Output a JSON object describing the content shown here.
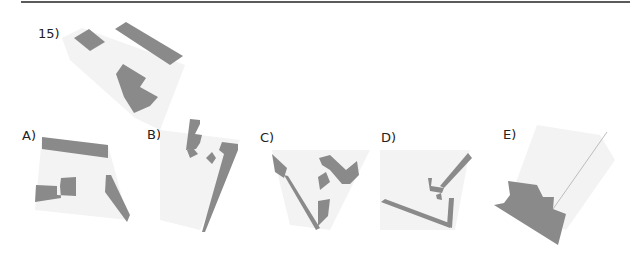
{
  "question": {
    "number_label": "15)",
    "options": [
      {
        "key": "A",
        "label": "A)"
      },
      {
        "key": "B",
        "label": "B)"
      },
      {
        "key": "C",
        "label": "C)"
      },
      {
        "key": "D",
        "label": "D)"
      },
      {
        "key": "E",
        "label": "E)"
      }
    ]
  },
  "colors": {
    "face_dark": "#8a8a8a",
    "face_light": "#f3f3f3",
    "rule": "#5a5a5a",
    "text": "#222222"
  },
  "shapes": {
    "question": {
      "light": [
        [
          62,
          38
        ],
        [
          82,
          28
        ],
        [
          185,
          65
        ],
        [
          160,
          130
        ],
        [
          135,
          118
        ],
        [
          70,
          60
        ]
      ],
      "dark": [
        [
          [
            74,
            38
          ],
          [
            89,
            29
          ],
          [
            105,
            42
          ],
          [
            90,
            51
          ]
        ],
        [
          [
            115,
            29
          ],
          [
            126,
            22
          ],
          [
            183,
            56
          ],
          [
            170,
            65
          ]
        ],
        [
          [
            116,
            74
          ],
          [
            123,
            64
          ],
          [
            146,
            78
          ],
          [
            140,
            87
          ],
          [
            158,
            97
          ],
          [
            150,
            106
          ],
          [
            134,
            113
          ],
          [
            124,
            97
          ]
        ]
      ]
    },
    "A": {
      "light": [
        [
          42,
          137
        ],
        [
          108,
          145
        ],
        [
          128,
          220
        ],
        [
          35,
          210
        ]
      ],
      "dark": [
        [
          [
            42,
            137
          ],
          [
            108,
            145
          ],
          [
            108,
            158
          ],
          [
            42,
            149
          ]
        ],
        [
          [
            106,
            175
          ],
          [
            111,
            175
          ],
          [
            130,
            215
          ],
          [
            127,
            222
          ],
          [
            105,
            192
          ]
        ],
        [
          [
            36,
            185
          ],
          [
            57,
            186
          ],
          [
            57,
            195
          ],
          [
            76,
            196
          ],
          [
            76,
            177
          ],
          [
            61,
            178
          ],
          [
            60,
            186
          ],
          [
            61,
            198
          ],
          [
            35,
            202
          ]
        ],
        [
          [
            62,
            179
          ],
          [
            76,
            178
          ],
          [
            76,
            193
          ],
          [
            62,
            193
          ]
        ]
      ]
    },
    "B": {
      "light": [
        [
          160,
          130
        ],
        [
          240,
          140
        ],
        [
          200,
          230
        ],
        [
          160,
          220
        ]
      ],
      "dark": [
        [
          [
            190,
            119
          ],
          [
            200,
            120
          ],
          [
            200,
            124
          ],
          [
            195,
            134
          ],
          [
            202,
            135
          ],
          [
            200,
            143
          ],
          [
            196,
            149
          ],
          [
            186,
            150
          ]
        ],
        [
          [
            187,
            150
          ],
          [
            193,
            148
          ],
          [
            198,
            154
          ],
          [
            190,
            158
          ]
        ],
        [
          [
            206,
            158
          ],
          [
            212,
            152
          ],
          [
            216,
            158
          ],
          [
            212,
            164
          ]
        ],
        [
          [
            222,
            142
          ],
          [
            238,
            144
          ],
          [
            238,
            150
          ],
          [
            205,
            232
          ],
          [
            202,
            232
          ],
          [
            224,
            154
          ],
          [
            219,
            150
          ]
        ]
      ]
    },
    "C": {
      "light": [
        [
          272,
          150
        ],
        [
          370,
          150
        ],
        [
          330,
          230
        ],
        [
          290,
          225
        ]
      ],
      "dark": [
        [
          [
            272,
            154
          ],
          [
            287,
            168
          ],
          [
            284,
            178
          ],
          [
            275,
            172
          ]
        ],
        [
          [
            284,
            175
          ],
          [
            288,
            176
          ],
          [
            320,
            228
          ],
          [
            316,
            230
          ]
        ],
        [
          [
            318,
            201
          ],
          [
            330,
            199
          ],
          [
            328,
            216
          ],
          [
            318,
            226
          ]
        ],
        [
          [
            318,
            177
          ],
          [
            326,
            172
          ],
          [
            330,
            182
          ],
          [
            320,
            190
          ]
        ],
        [
          [
            319,
            158
          ],
          [
            330,
            155
          ],
          [
            346,
            170
          ],
          [
            357,
            161
          ],
          [
            359,
            175
          ],
          [
            350,
            184
          ],
          [
            342,
            184
          ],
          [
            330,
            170
          ],
          [
            322,
            165
          ]
        ]
      ]
    },
    "D": {
      "light": [
        [
          380,
          150
        ],
        [
          470,
          150
        ],
        [
          455,
          230
        ],
        [
          380,
          230
        ]
      ],
      "dark": [
        [
          [
            381,
            202
          ],
          [
            385,
            199
          ],
          [
            452,
            224
          ],
          [
            450,
            228
          ]
        ],
        [
          [
            449,
            198
          ],
          [
            454,
            198
          ],
          [
            452,
            228
          ],
          [
            447,
            226
          ]
        ],
        [
          [
            468,
            153
          ],
          [
            472,
            158
          ],
          [
            444,
            188
          ],
          [
            440,
            186
          ]
        ],
        [
          [
            428,
            178
          ],
          [
            432,
            178
          ],
          [
            431,
            186
          ],
          [
            444,
            188
          ],
          [
            442,
            193
          ],
          [
            430,
            191
          ]
        ],
        [
          [
            436,
            195
          ],
          [
            441,
            193
          ],
          [
            442,
            200
          ],
          [
            437,
            199
          ]
        ]
      ]
    },
    "E": {
      "light": [
        [
          537,
          125
        ],
        [
          600,
          135
        ],
        [
          615,
          160
        ],
        [
          566,
          230
        ],
        [
          540,
          220
        ],
        [
          515,
          185
        ]
      ],
      "dark": [
        [
          [
            508,
            181
          ],
          [
            537,
            185
          ],
          [
            543,
            197
          ],
          [
            554,
            197
          ],
          [
            553,
            209
          ],
          [
            566,
            214
          ],
          [
            558,
            245
          ],
          [
            494,
            205
          ],
          [
            504,
            203
          ],
          [
            510,
            195
          ]
        ],
        [
          [
            533,
            205
          ],
          [
            540,
            203
          ],
          [
            540,
            210
          ],
          [
            534,
            210
          ]
        ]
      ],
      "edge": [
        [
          553,
          209
        ],
        [
          607,
          132
        ]
      ]
    }
  }
}
